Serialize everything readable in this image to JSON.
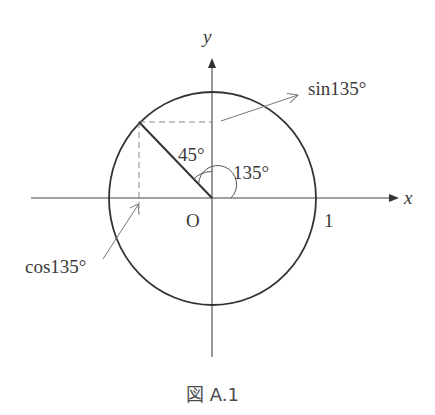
{
  "figure": {
    "caption": "図 A.1",
    "axes": {
      "x_label": "x",
      "y_label": "y",
      "origin_label": "O",
      "unit_tick_label": "1"
    },
    "angles": {
      "inner_angle_label": "45°",
      "outer_angle_label": "135°"
    },
    "annotations": {
      "sin_label": "sin135°",
      "cos_label": "cos135°"
    },
    "colors": {
      "stroke": "#333333",
      "dash": "#888888",
      "arrow_annotation": "#777777"
    }
  }
}
